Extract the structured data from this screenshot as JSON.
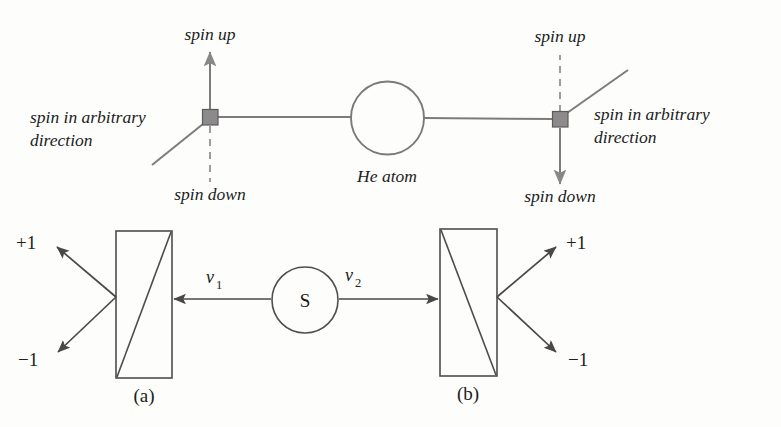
{
  "figure": {
    "background_color": "#fdfdfb",
    "ink_color": "#231f20",
    "node_fill_color": "#8d8a8c",
    "line_color_grey": "#7d7b7c",
    "line_color_dark": "#4b4749"
  },
  "top_diagram": {
    "name": "he-atom-spin-diagram",
    "center_label": "He atom",
    "left_detector": {
      "spin_up_label": "spin up",
      "spin_down_label": "spin down",
      "arbitrary_label_line1": "spin in arbitrary",
      "arbitrary_label_line2": "direction",
      "up_is_solid_arrow": true,
      "down_is_dashed": true
    },
    "right_detector": {
      "spin_up_label": "spin up",
      "spin_down_label": "spin down",
      "arbitrary_label_line1": "spin in arbitrary",
      "arbitrary_label_line2": "direction",
      "up_is_solid_arrow": false,
      "down_is_dashed": false
    }
  },
  "bottom_diagram": {
    "name": "polarizer-source-diagram",
    "source_label": "S",
    "velocity_left_var": "v",
    "velocity_left_sub": "1",
    "velocity_right_var": "v",
    "velocity_right_sub": "2",
    "left_analyzer": {
      "caption": "(a)",
      "output_plus": "+1",
      "output_minus": "−1",
      "diagonal": "bottom-left-to-top-right",
      "outputs_on": "left"
    },
    "right_analyzer": {
      "caption": "(b)",
      "output_plus": "+1",
      "output_minus": "−1",
      "diagonal": "top-left-to-bottom-right",
      "outputs_on": "right"
    }
  }
}
